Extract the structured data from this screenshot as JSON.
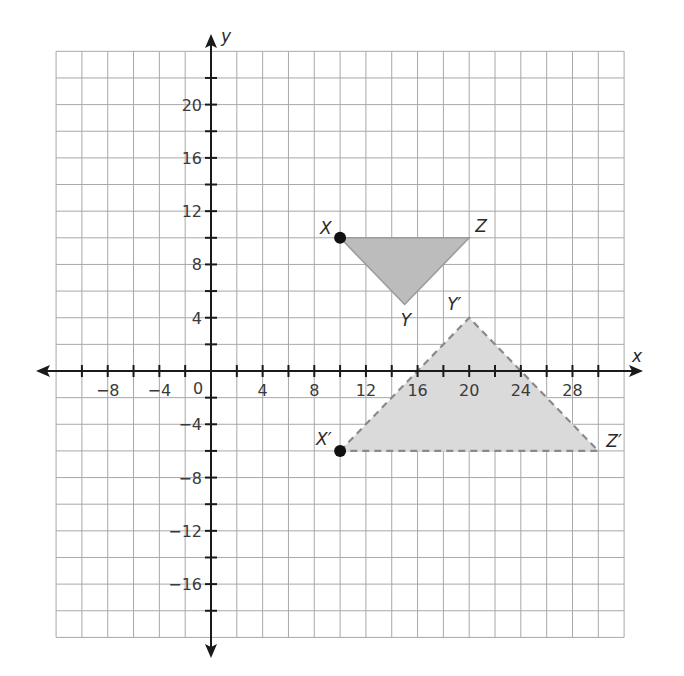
{
  "figure": {
    "x_axis_label": "x",
    "y_axis_label": "y",
    "origin_label": "0",
    "x_range": [
      -12,
      32
    ],
    "y_range": [
      -20,
      24
    ],
    "grid_step": 2,
    "x_tick_labels": [
      {
        "value": -8,
        "text": "−8"
      },
      {
        "value": -4,
        "text": "−4"
      },
      {
        "value": 4,
        "text": "4"
      },
      {
        "value": 8,
        "text": "8"
      },
      {
        "value": 12,
        "text": "12"
      },
      {
        "value": 16,
        "text": "16"
      },
      {
        "value": 20,
        "text": "20"
      },
      {
        "value": 24,
        "text": "24"
      },
      {
        "value": 28,
        "text": "28"
      }
    ],
    "y_tick_labels": [
      {
        "value": 20,
        "text": "20"
      },
      {
        "value": 16,
        "text": "16"
      },
      {
        "value": 12,
        "text": "12"
      },
      {
        "value": 8,
        "text": "8"
      },
      {
        "value": 4,
        "text": "4"
      },
      {
        "value": -4,
        "text": "−4"
      },
      {
        "value": -8,
        "text": "−8"
      },
      {
        "value": -12,
        "text": "−12"
      },
      {
        "value": -16,
        "text": "−16"
      }
    ],
    "triangles": [
      {
        "name": "XYZ",
        "style": "solid",
        "fill": "#bcbcbc",
        "vertices": [
          {
            "label": "X",
            "x": 10,
            "y": 10,
            "dot": true
          },
          {
            "label": "Y",
            "x": 15,
            "y": 5,
            "dot": false
          },
          {
            "label": "Z",
            "x": 20,
            "y": 10,
            "dot": false
          }
        ]
      },
      {
        "name": "X'Y'Z'",
        "style": "dashed",
        "fill": "#dadada",
        "vertices": [
          {
            "label": "X′",
            "x": 10,
            "y": -6,
            "dot": true
          },
          {
            "label": "Y′",
            "x": 20,
            "y": 4,
            "dot": false
          },
          {
            "label": "Z′",
            "x": 30,
            "y": -6,
            "dot": false
          }
        ]
      }
    ]
  }
}
